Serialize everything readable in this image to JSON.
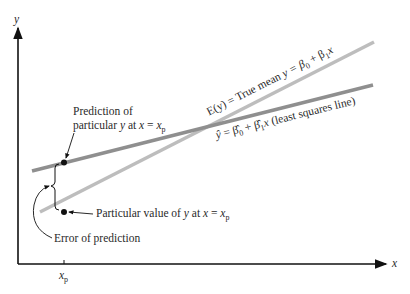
{
  "axes": {
    "y_label": "y",
    "x_label": "x",
    "x_tick_label": "x",
    "x_tick_sub": "p"
  },
  "lines": {
    "true_mean": {
      "color": "#b8b8b8",
      "label_prefix": "E(y) = True mean ",
      "label_eq": "y = β",
      "sub0": "0",
      "plus": " + β",
      "sub1": "1",
      "var": "x"
    },
    "least_squares": {
      "color": "#8c8c8c",
      "label_yhat": "ŷ",
      "label_eq": " = β̂",
      "sub0": "0",
      "plus": " + β̂",
      "sub1": "1",
      "var": "x",
      "suffix": " (least squares line)"
    }
  },
  "annotations": {
    "prediction_line1": "Prediction of",
    "prediction_line2_a": "particular ",
    "prediction_line2_y": "y",
    "prediction_line2_b": " at ",
    "prediction_line2_x": "x",
    "prediction_line2_c": " = ",
    "prediction_line2_xp": "x",
    "prediction_line2_p": "p",
    "particular_a": "Particular value of ",
    "particular_y": "y",
    "particular_b": " at ",
    "particular_x": "x",
    "particular_c": " = ",
    "particular_xp": "x",
    "particular_p": "p",
    "error": "Error of prediction"
  }
}
